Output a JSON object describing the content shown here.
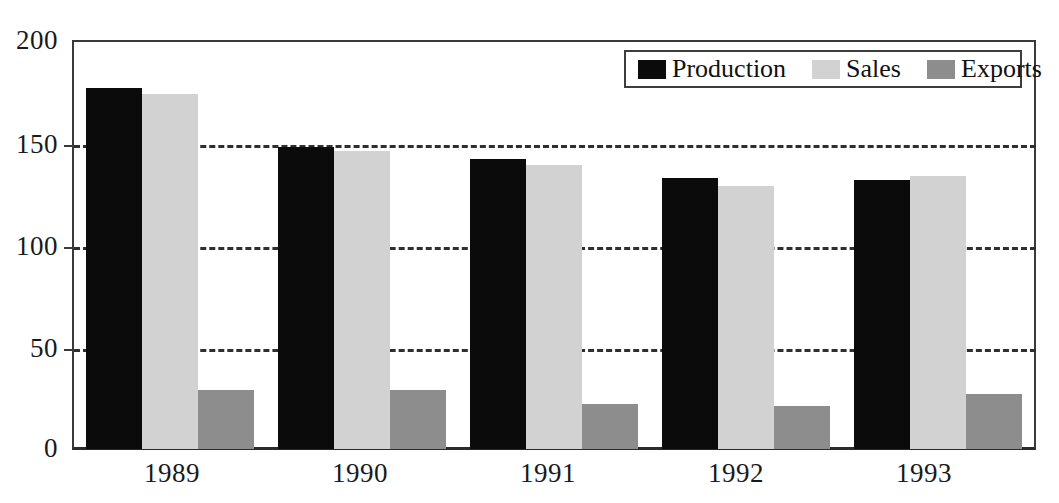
{
  "chart_data": {
    "type": "bar",
    "title": "",
    "subtitle": "",
    "xlabel": "",
    "ylabel": "",
    "categories": [
      "1989",
      "1990",
      "1991",
      "1992",
      "1993"
    ],
    "series": [
      {
        "name": "Production",
        "color": "#0b0b0b",
        "values": [
          177,
          148,
          142,
          133,
          132
        ]
      },
      {
        "name": "Sales",
        "color": "#d2d2d2",
        "values": [
          174,
          146,
          139,
          129,
          134
        ]
      },
      {
        "name": "Exports",
        "color": "#8d8d8d",
        "values": [
          29,
          29,
          22,
          21,
          27
        ]
      }
    ],
    "ylim": [
      0,
      200
    ],
    "yticks": [
      0,
      50,
      100,
      150,
      200
    ],
    "ytick_labels": [
      "0",
      "50",
      "100",
      "150",
      "200"
    ],
    "grid": "horizontal-dashed",
    "gridlines_at": [
      50,
      100,
      150
    ],
    "legend_position": "top-right",
    "axis_line_color": "#3a3a3a",
    "background": "#ffffff"
  },
  "legend": {
    "items": [
      {
        "label": "Production",
        "swatch": "#0b0b0b"
      },
      {
        "label": "Sales",
        "swatch": "#d2d2d2"
      },
      {
        "label": "Exports",
        "swatch": "#8d8d8d"
      }
    ]
  },
  "axis": {
    "y_labels": [
      "200",
      "150",
      "100",
      "50",
      "0"
    ],
    "x_labels": [
      "1989",
      "1990",
      "1991",
      "1992",
      "1993"
    ]
  }
}
